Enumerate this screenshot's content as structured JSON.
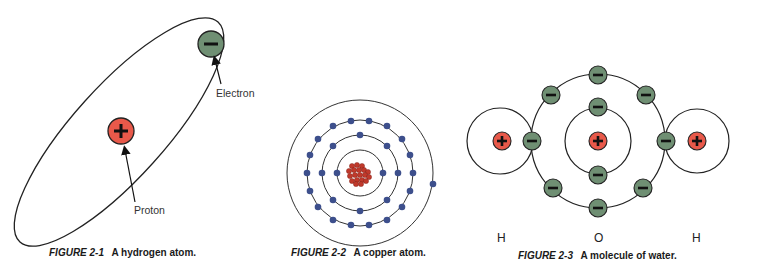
{
  "colors": {
    "proton_fill": "#e8594a",
    "electron_fill": "#6f8f73",
    "copper_electron": "#3d4f8c",
    "copper_nucleus": "#c0392b",
    "orbit_stroke": "#222222",
    "background": "#ffffff"
  },
  "figures": [
    {
      "id": "2-1",
      "caption_prefix": "FIGURE 2-1",
      "caption_text": "A hydrogen atom.",
      "labels": {
        "electron": "Electron",
        "proton": "Proton"
      },
      "electron_symbol": "−",
      "proton_symbol": "+"
    },
    {
      "id": "2-2",
      "caption_prefix": "FIGURE 2-2",
      "caption_text": "A copper atom.",
      "shells": [
        2,
        8,
        18,
        1
      ]
    },
    {
      "id": "2-3",
      "caption_prefix": "FIGURE 2-3",
      "caption_text": "A molecule of water.",
      "atom_labels": [
        "H",
        "O",
        "H"
      ]
    }
  ]
}
